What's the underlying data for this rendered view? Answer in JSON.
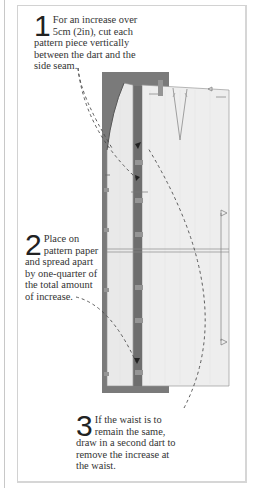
{
  "steps": [
    {
      "number": "1",
      "text": "For an increase over 5cm (2in), cut each pattern piece vertically between the dart and the side seam."
    },
    {
      "number": "2",
      "text": "Place on pattern paper and spread apart by one-quarter of the total amount of increase."
    },
    {
      "number": "3",
      "text": "If the waist is to remain the same, draw in a second dart to remove the increase at the waist."
    }
  ],
  "colors": {
    "backing_paper": "#7a7a7a",
    "pattern_piece": "#ececec",
    "pattern_outline": "#9a9a9a",
    "dashed_arrow": "#4a4a4a",
    "panel_border": "#d2d2d2"
  }
}
